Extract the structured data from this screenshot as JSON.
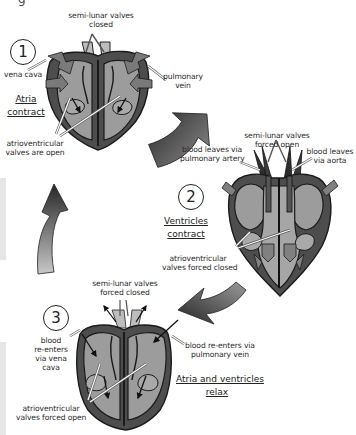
{
  "page_fragment": "g",
  "colors": {
    "heart_outer": "#4a4a4a",
    "heart_chamber": "#9a9a9a",
    "heart_chamber_light": "#b8b8b8",
    "outline": "#1a1a1a",
    "cycle_arrow_dark": "#2f2f2f",
    "cycle_arrow_light": "#bdbdbd",
    "margin_bar": "#e6e6e6"
  },
  "stages": [
    {
      "number": "1",
      "title_line1": "Atria",
      "title_line2": "contract",
      "labels": {
        "top_line1": "semi-lunar valves",
        "top_line2": "closed",
        "left": "vena cava",
        "right_line1": "pulmonary",
        "right_line2": "vein",
        "bottom_line1": "atrioventricular",
        "bottom_line2": "valves are open"
      }
    },
    {
      "number": "2",
      "title_line1": "Ventricles",
      "title_line2": "contract",
      "labels": {
        "top_line1": "semi-lunar valves",
        "top_line2": "forced open",
        "left_line1": "blood leaves via",
        "left_line2": "pulmonary artery",
        "right_line1": "blood leaves",
        "right_line2": "via aorta",
        "bottom_line1": "atrioventricular",
        "bottom_line2": "valves forced closed"
      }
    },
    {
      "number": "3",
      "title_line1": "Atria and ventricles",
      "title_line2": "relax",
      "labels": {
        "top_line1": "semi-lunar valves",
        "top_line2": "forced closed",
        "left_line1": "blood",
        "left_line2": "re-enters",
        "left_line3": "via vena",
        "left_line4": "cava",
        "right_line1": "blood re-enters via",
        "right_line2": "pulmonary vein",
        "bottom_line1": "atrioventricular",
        "bottom_line2": "valves forced open"
      }
    }
  ],
  "cycle_arrows": [
    {
      "from": "stage-1",
      "to": "stage-2",
      "icon": "curved-arrow-down-right"
    },
    {
      "from": "stage-2",
      "to": "stage-3",
      "icon": "curved-arrow-down-left"
    },
    {
      "from": "stage-3",
      "to": "stage-1",
      "icon": "curved-arrow-up"
    }
  ]
}
